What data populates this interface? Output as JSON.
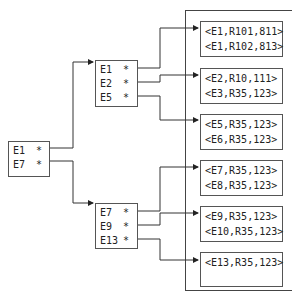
{
  "root_index": {
    "entries": [
      {
        "key": "E1",
        "pointer": "*"
      },
      {
        "key": "E7",
        "pointer": "*"
      }
    ]
  },
  "mid_index": [
    {
      "entries": [
        {
          "key": "E1",
          "pointer": "*"
        },
        {
          "key": "E2",
          "pointer": "*"
        },
        {
          "key": "E5",
          "pointer": "*"
        }
      ]
    },
    {
      "entries": [
        {
          "key": "E7",
          "pointer": "*"
        },
        {
          "key": "E9",
          "pointer": "*"
        },
        {
          "key": "E13",
          "pointer": "*"
        }
      ]
    }
  ],
  "leaf_pages": [
    {
      "records": [
        "<E1,R101,811>",
        "<E1,R102,813>"
      ]
    },
    {
      "records": [
        "<E2,R10,111>",
        "<E3,R35,123>"
      ]
    },
    {
      "records": [
        "<E5,R35,123>",
        "<E6,R35,123>"
      ]
    },
    {
      "records": [
        "<E7,R35,123>",
        "<E8,R35,123>"
      ]
    },
    {
      "records": [
        "<E9,R35,123>",
        "<E10,R35,123>"
      ]
    },
    {
      "records": [
        "<E13,R35,123>"
      ]
    }
  ]
}
